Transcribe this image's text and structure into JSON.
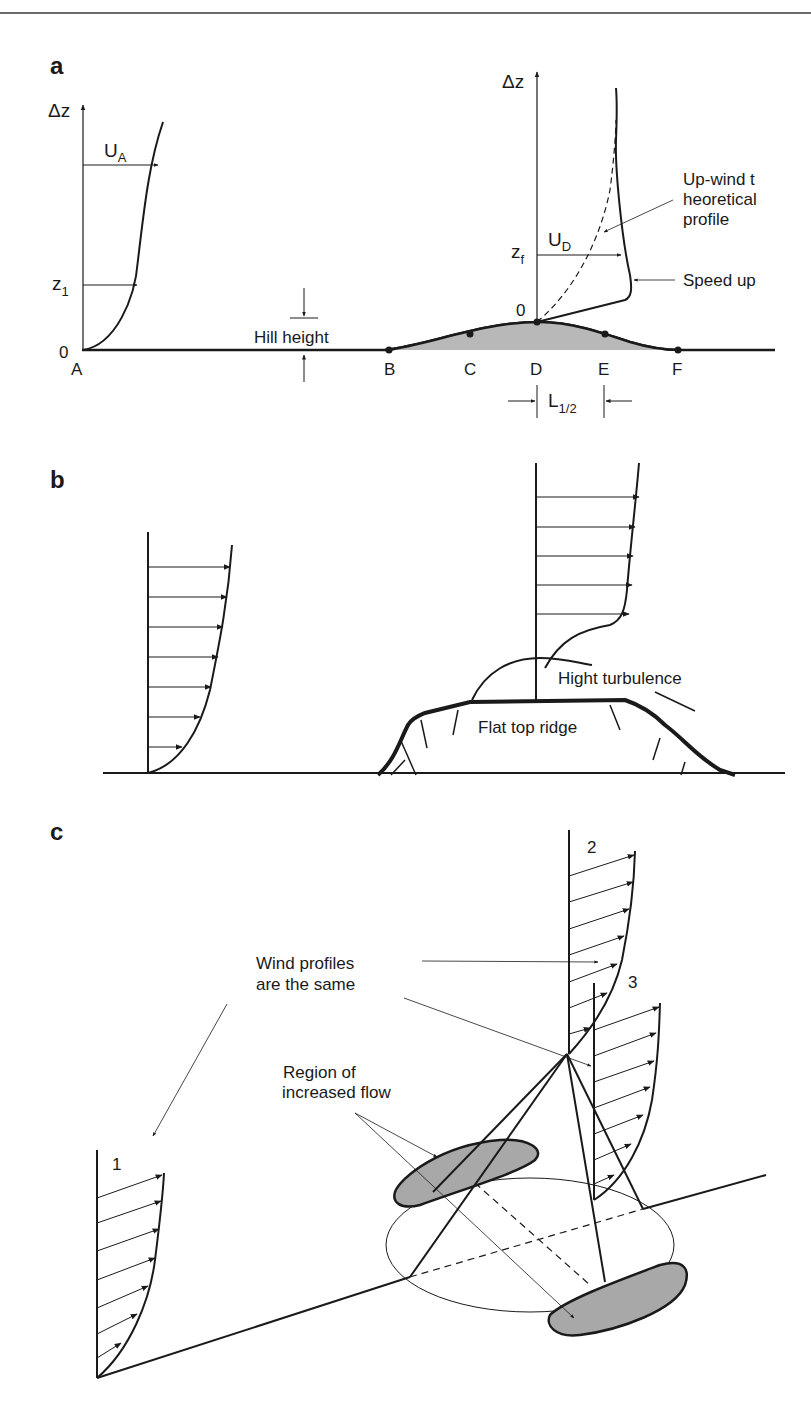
{
  "panels": {
    "a": {
      "label": "a",
      "axis_upwind": "Δz",
      "axis_crest": "Δz",
      "speed_upwind": "U",
      "speed_upwind_sub": "A",
      "height_upwind": "z",
      "height_upwind_sub": "1",
      "speed_crest": "U",
      "speed_crest_sub": "D",
      "height_crest": "z",
      "height_crest_sub": "f",
      "origin_upwind": "0",
      "origin_crest": "0",
      "hill_height": "Hill height",
      "theory_line1": "Up-wind t",
      "theory_line2": "heoretical",
      "theory_line3": "profile",
      "speed_up": "Speed up",
      "points": [
        "A",
        "B",
        "C",
        "D",
        "E",
        "F"
      ],
      "half_length": "L",
      "half_length_sub": "1/2"
    },
    "b": {
      "label": "b",
      "turbulence": "Hight turbulence",
      "ridge": "Flat top ridge"
    },
    "c": {
      "label": "c",
      "profile_1": "1",
      "profile_2": "2",
      "profile_3": "3",
      "same_line1": "Wind profiles",
      "same_line2": "are the same",
      "region_line1": "Region of",
      "region_line2": "increased flow"
    }
  },
  "colors": {
    "line": "#1a1a1a",
    "hill_fill": "#b8b8b8",
    "region_fill": "#a8a8a8",
    "rule": "#6a6a6a"
  }
}
